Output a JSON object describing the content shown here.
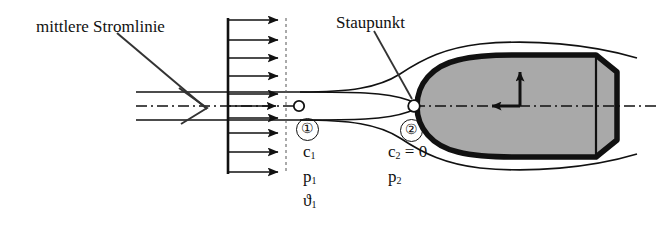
{
  "figure": {
    "type": "diagram",
    "background_color": "#ffffff",
    "line_color": "#111111",
    "body_fill_color": "#a9a9a9",
    "body_outline_color": "#111111"
  },
  "annotations": {
    "streamline_label": "mittlere Stromlinie",
    "stagnation_label": "Staupunkt"
  },
  "stations": {
    "one": {
      "marker": "①",
      "velocity": "c",
      "velocity_sub": "1",
      "pressure": "p",
      "pressure_sub": "1",
      "temperature": "ϑ",
      "temperature_sub": "1"
    },
    "two": {
      "marker": "②",
      "velocity": "c",
      "velocity_sub": "2",
      "velocity_value": " = 0",
      "pressure": "p",
      "pressure_sub": "2"
    }
  },
  "flow": {
    "arrow_count": 9,
    "rake_x": 228,
    "arrow_tip_x": 286,
    "arrow_rows_y": [
      20,
      40,
      58,
      76,
      94,
      112,
      133,
      152,
      172
    ],
    "centerline_y": 106
  },
  "axes": {
    "origin_x": 520,
    "origin_y": 106,
    "vertical_arrow_to_y": 66,
    "horizontal_arrow_to_x": 485
  }
}
